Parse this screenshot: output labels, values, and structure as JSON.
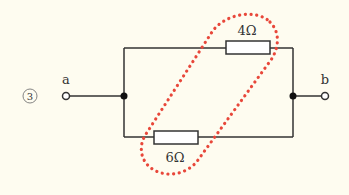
{
  "problem": {
    "number_label": "③"
  },
  "circuit": {
    "terminal_a": {
      "label": "a"
    },
    "terminal_b": {
      "label": "b"
    },
    "resistors": [
      {
        "id": "R-top",
        "value": "4Ω",
        "branch": "top"
      },
      {
        "id": "R-bottom",
        "value": "6Ω",
        "branch": "bottom"
      }
    ],
    "highlight": {
      "description": "red dotted loop enclosing both resistors",
      "color": "#e8473a"
    }
  },
  "colors": {
    "background": "#fefcf0",
    "wire": "#333333",
    "highlight": "#e8473a"
  }
}
